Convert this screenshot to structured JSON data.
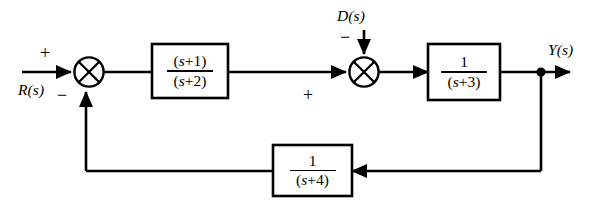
{
  "diagram": {
    "type": "control-system-block-diagram",
    "colors": {
      "background": "#ffffff",
      "stroke": "#000000",
      "text": "#000000"
    },
    "signals": {
      "input_label": "R(s)",
      "disturbance_label": "D(s)",
      "output_label": "Y(s)"
    },
    "summers": [
      {
        "name": "summer-1",
        "inputs": [
          {
            "label": "+",
            "source": "R(s)",
            "direction": "from-left"
          },
          {
            "label": "−",
            "source": "feedback",
            "direction": "from-below"
          }
        ]
      },
      {
        "name": "summer-2",
        "inputs": [
          {
            "label": "+",
            "source": "forward-path",
            "direction": "from-left"
          },
          {
            "label": "−",
            "source": "D(s)",
            "direction": "from-above"
          }
        ]
      }
    ],
    "blocks": [
      {
        "name": "block-forward-1",
        "numerator": "(s+1)",
        "denominator": "(s+2)",
        "numerator_var": "s",
        "numerator_op": "+",
        "numerator_const": "1",
        "denominator_var": "s",
        "denominator_op": "+",
        "denominator_const": "2"
      },
      {
        "name": "block-forward-2",
        "numerator": "1",
        "denominator": "(s+3)",
        "denominator_var": "s",
        "denominator_op": "+",
        "denominator_const": "3"
      },
      {
        "name": "block-feedback",
        "numerator": "1",
        "denominator": "(s+4)",
        "denominator_var": "s",
        "denominator_op": "+",
        "denominator_const": "4"
      }
    ],
    "signs": {
      "summer1_plus": "+",
      "summer1_minus": "−",
      "summer2_plus": "+",
      "summer2_minus": "−"
    },
    "parens": {
      "open": "(",
      "close": ")"
    },
    "numerals": {
      "one": "1"
    }
  }
}
